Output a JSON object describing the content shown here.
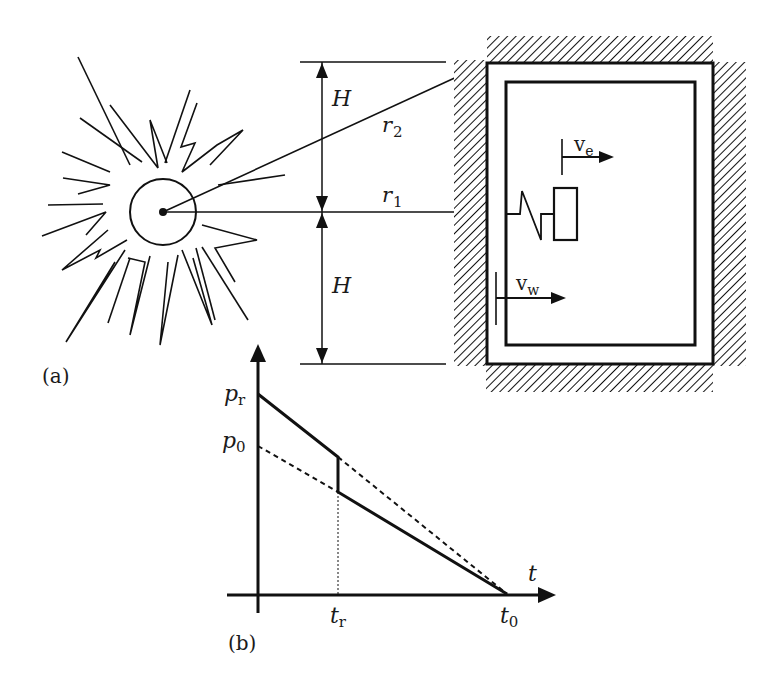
{
  "figure": {
    "panel_a": {
      "label": "(a)",
      "explosion": {
        "center": [
          163,
          212
        ],
        "core_radius": 33
      },
      "dimensions": {
        "upper": "H",
        "lower": "H"
      },
      "rays": {
        "r1": "r",
        "r1_sub": "1",
        "r2": "r",
        "r2_sub": "2"
      },
      "structure": {
        "gauges": [
          {
            "name": "v",
            "sub": "e"
          },
          {
            "name": "v",
            "sub": "w"
          }
        ],
        "oscillator": "spring-mass"
      }
    },
    "panel_b": {
      "label": "(b)",
      "y_labels": [
        {
          "main": "p",
          "sub": "r"
        },
        {
          "main": "p",
          "sub": "0"
        }
      ],
      "x_labels": [
        {
          "main": "t",
          "sub": "r"
        },
        {
          "main": "t",
          "sub": "0"
        }
      ],
      "x_axis_label": "t"
    }
  },
  "colors": {
    "ink": "#111111",
    "background": "#ffffff"
  }
}
